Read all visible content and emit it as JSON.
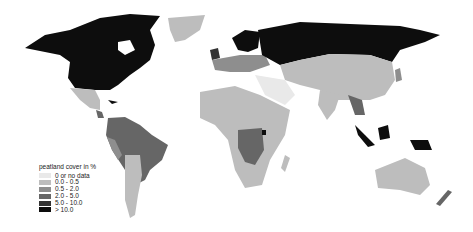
{
  "map": {
    "title": "peatland cover in %",
    "legend": [
      {
        "label": "0 or no data",
        "color": "#e9e9e9"
      },
      {
        "label": "0.0 - 0.5",
        "color": "#bdbdbd"
      },
      {
        "label": "0.5 - 2.0",
        "color": "#8e8e8e"
      },
      {
        "label": "2.0 - 5.0",
        "color": "#666666"
      },
      {
        "label": "5.0 - 10.0",
        "color": "#333333"
      },
      {
        "label": "> 10.0",
        "color": "#0d0d0d"
      }
    ]
  }
}
